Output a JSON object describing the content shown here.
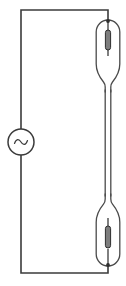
{
  "diagram": {
    "type": "schematic",
    "canvas": {
      "width": 126,
      "height": 286,
      "background": "#ffffff"
    },
    "colors": {
      "wire": "#3b3b3b",
      "glass": "#4a4a4a",
      "electrode_fill": "#7d7d7d",
      "electrode_stroke": "#2e2e2e",
      "background": "#ffffff"
    },
    "components": [
      {
        "id": "ac-source",
        "name": "AC voltage source",
        "symbol": "circle-with-sine",
        "glyph": "∿",
        "position": {
          "cx": 21,
          "cy": 142,
          "r": 13
        }
      },
      {
        "id": "upper-bulb",
        "name": "Upper discharge bulb",
        "symbol": "capsule-with-electrode",
        "position": {
          "cx": 108,
          "top": 20,
          "bottom": 88,
          "width": 24
        },
        "electrode": {
          "x": 105.2,
          "y": 30,
          "width": 5,
          "height": 20
        }
      },
      {
        "id": "connecting-neck",
        "name": "Capillary neck",
        "symbol": "narrow-tube",
        "position": {
          "cx": 108,
          "top": 88,
          "bottom": 198,
          "width": 5.5
        }
      },
      {
        "id": "lower-bulb",
        "name": "Lower discharge bulb",
        "symbol": "capsule-with-electrode",
        "position": {
          "cx": 108,
          "top": 198,
          "bottom": 266,
          "width": 24
        },
        "electrode": {
          "x": 105.2,
          "y": 226,
          "width": 5,
          "height": 22
        }
      }
    ],
    "wires": [
      {
        "id": "top-wire",
        "name": "Top horizontal wire",
        "path": "M 21 142 L 21 10 L 108 10 L 108 20"
      },
      {
        "id": "bottom-wire",
        "name": "Bottom horizontal wire",
        "path": "M 21 142 L 21 273 L 108 273 L 108 266"
      }
    ],
    "nodes": [
      {
        "id": "top-node",
        "name": "Top terminal node",
        "cx": 108,
        "cy": 21
      },
      {
        "id": "bottom-node",
        "name": "Bottom terminal node",
        "cx": 108,
        "cy": 265
      }
    ],
    "labels": []
  }
}
